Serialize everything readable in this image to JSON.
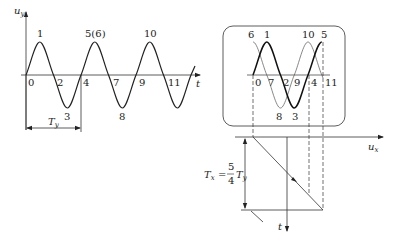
{
  "left_plot": {
    "y_axis_label": "u",
    "y_axis_sub": "y",
    "x_axis_label": "t",
    "period_label": "T",
    "period_sub": "y",
    "points": [
      {
        "label": "0",
        "x": 28,
        "y": 86
      },
      {
        "label": "1",
        "x": 37,
        "y": 37
      },
      {
        "label": "2",
        "x": 57,
        "y": 86
      },
      {
        "label": "3",
        "x": 66,
        "y": 120
      },
      {
        "label": "4",
        "x": 83,
        "y": 86
      },
      {
        "label": "5(6)",
        "x": 85,
        "y": 37
      },
      {
        "label": "7",
        "x": 113,
        "y": 86
      },
      {
        "label": "8",
        "x": 120,
        "y": 120
      },
      {
        "label": "9",
        "x": 137,
        "y": 86
      },
      {
        "label": "10",
        "x": 144,
        "y": 37
      },
      {
        "label": "11",
        "x": 168,
        "y": 86
      }
    ]
  },
  "right_plot": {
    "x_axis_label": "u",
    "x_axis_sub": "x",
    "t_axis_label": "t",
    "formula": {
      "lhs": "T",
      "lhs_sub": "x",
      "eq": "=",
      "num": "5",
      "den": "4",
      "rhs": "T",
      "rhs_sub": "y"
    },
    "thick_points": [
      {
        "label": "0",
        "x": 254,
        "y": 86
      },
      {
        "label": "1",
        "x": 264,
        "y": 38
      },
      {
        "label": "2",
        "x": 283,
        "y": 86
      },
      {
        "label": "3",
        "x": 292,
        "y": 120
      },
      {
        "label": "4",
        "x": 311,
        "y": 86
      },
      {
        "label": "5",
        "x": 321,
        "y": 38
      }
    ],
    "thin_points": [
      {
        "label": "6",
        "x": 248,
        "y": 38
      },
      {
        "label": "7",
        "x": 268,
        "y": 86
      },
      {
        "label": "8",
        "x": 276,
        "y": 120
      },
      {
        "label": "9",
        "x": 294,
        "y": 86
      },
      {
        "label": "10",
        "x": 302,
        "y": 38
      },
      {
        "label": "11",
        "x": 325,
        "y": 86
      }
    ]
  }
}
